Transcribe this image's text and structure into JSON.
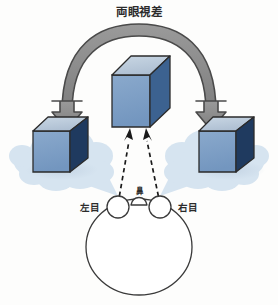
{
  "figure": {
    "title": "両眼視差",
    "background_color": "#fdfdfc",
    "labels": {
      "left_eye": "左目",
      "right_eye": "右目",
      "nose": "鼻"
    },
    "arc_arrow": {
      "name": "binocular-disparity-arc",
      "fill_color": "#8c8c8c",
      "stroke_color": "#4a4a4a",
      "description_head_left": "arrow-head-left",
      "description_head_right": "arrow-head-right"
    },
    "cubes": [
      {
        "id": "left-eye-view-cube",
        "top_color": "#b9cadb",
        "front_color": "#7b9fc6",
        "side_color": "#1f3a5f",
        "outline_color": "#2b2b2b"
      },
      {
        "id": "center-cube",
        "top_color": "#b9cadb",
        "front_color": "#7b9fc6",
        "side_color": "#3c6290",
        "outline_color": "#2b2b2b"
      },
      {
        "id": "right-eye-view-cube",
        "top_color": "#b9cadb",
        "front_color": "#7b9fc6",
        "side_color": "#1f3a5f",
        "outline_color": "#2b2b2b"
      }
    ],
    "thought_bubbles": {
      "fill_color": "#d6e4f0",
      "count": 2
    },
    "sight_lines": {
      "style": "dashed",
      "color": "#1a1a1a",
      "count": 2
    },
    "head": {
      "outline_color": "#3a3a3a",
      "fill_color": "#ffffff"
    }
  }
}
